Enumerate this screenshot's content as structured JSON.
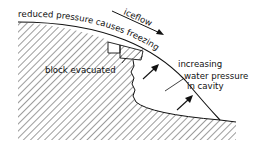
{
  "diagram": {
    "type": "glacier-bed-cavity cross-section",
    "labels": {
      "top_curve": "reduced pressure causes freezing",
      "flow": "iceflow",
      "block": "block evacuated",
      "cavity_line1": "increasing",
      "cavity_line2": "water pressure",
      "cavity_line3": "in cavity"
    },
    "icons": {
      "flow_arrow": "arrow-down-right-icon",
      "pressure_arrows": "arrow-up-right-icon"
    },
    "colors": {
      "ink": "#111111",
      "background": "#ffffff"
    }
  }
}
